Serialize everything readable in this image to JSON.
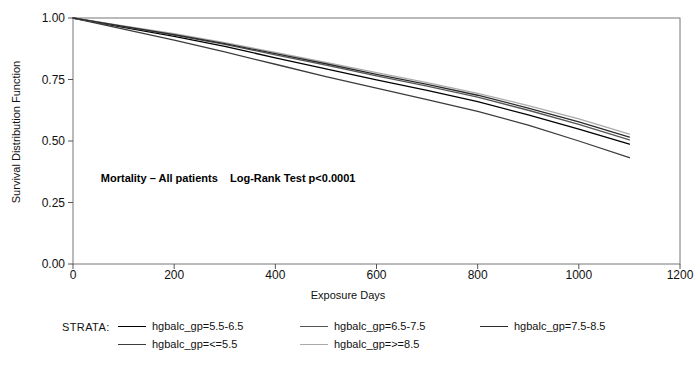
{
  "chart_data": {
    "type": "line",
    "title": "",
    "xlabel": "Exposure Days",
    "ylabel": "Survival Distribution Function",
    "xlim": [
      0,
      1200
    ],
    "ylim": [
      0.0,
      1.0
    ],
    "xticks": [
      0,
      200,
      400,
      600,
      800,
      1000,
      1200
    ],
    "yticks": [
      "0.00",
      "0.25",
      "0.50",
      "0.75",
      "1.00"
    ],
    "grid": false,
    "legend_position": "bottom",
    "legend_title": "STRATA:",
    "annotation": "Mortality – All patients    Log-Rank Test p<0.0001",
    "x": [
      0,
      100,
      200,
      300,
      400,
      500,
      600,
      700,
      800,
      900,
      1000,
      1100
    ],
    "series": [
      {
        "name": "hgbalc_gp=5.5-6.5",
        "color": "#000000",
        "values": [
          1.0,
          0.962,
          0.925,
          0.885,
          0.838,
          0.793,
          0.748,
          0.706,
          0.66,
          0.606,
          0.548,
          0.487
        ]
      },
      {
        "name": "hgbalc_gp=<=5.5",
        "color": "#3c3c3c",
        "values": [
          1.0,
          0.955,
          0.91,
          0.862,
          0.812,
          0.762,
          0.715,
          0.668,
          0.62,
          0.565,
          0.5,
          0.432
        ]
      },
      {
        "name": "hgbalc_gp=6.5-7.5",
        "color": "#555555",
        "values": [
          1.0,
          0.965,
          0.93,
          0.893,
          0.85,
          0.808,
          0.765,
          0.723,
          0.678,
          0.625,
          0.568,
          0.505
        ]
      },
      {
        "name": "hgbalc_gp=>=8.5",
        "color": "#aaaaaa",
        "values": [
          1.0,
          0.968,
          0.936,
          0.9,
          0.86,
          0.82,
          0.778,
          0.737,
          0.694,
          0.644,
          0.59,
          0.528
        ]
      },
      {
        "name": "hgbalc_gp=7.5-8.5",
        "color": "#2b2b2b",
        "values": [
          1.0,
          0.966,
          0.932,
          0.896,
          0.855,
          0.814,
          0.771,
          0.73,
          0.686,
          0.634,
          0.578,
          0.516
        ]
      }
    ]
  },
  "legend": {
    "title": "STRATA:",
    "items": [
      {
        "label": "hgbalc_gp=5.5-6.5",
        "color": "#000000",
        "col": 0,
        "row": 0
      },
      {
        "label": "hgbalc_gp=6.5-7.5",
        "color": "#555555",
        "col": 1,
        "row": 0
      },
      {
        "label": "hgbalc_gp=7.5-8.5",
        "color": "#2b2b2b",
        "col": 2,
        "row": 0
      },
      {
        "label": "hgbalc_gp=<=5.5",
        "color": "#3c3c3c",
        "col": 0,
        "row": 1
      },
      {
        "label": "hgbalc_gp=>=8.5",
        "color": "#aaaaaa",
        "col": 1,
        "row": 1
      }
    ]
  },
  "annotation": {
    "text": "Mortality – All patients    Log-Rank Test p<0.0001"
  },
  "axes": {
    "x_title": "Exposure Days",
    "y_title": "Survival Distribution Function"
  }
}
